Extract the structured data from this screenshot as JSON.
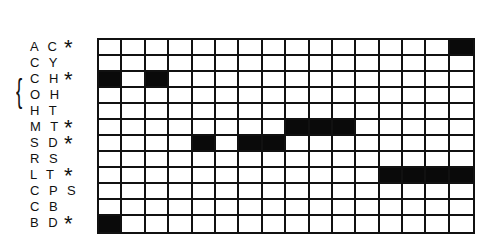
{
  "diagram": {
    "columns": 16,
    "fill_color": "#0a0a0a",
    "line_color": "#111111",
    "bracket": {
      "rows": [
        "CH",
        "OH"
      ],
      "glyph": "{"
    },
    "rows": [
      {
        "label": "A C",
        "code": "AC",
        "star": "*",
        "filled": [
          16
        ]
      },
      {
        "label": "C Y",
        "code": "CY",
        "star": "",
        "filled": []
      },
      {
        "label": "C H",
        "code": "CH",
        "star": "*",
        "filled": [
          1,
          3
        ]
      },
      {
        "label": "O H",
        "code": "OH",
        "star": "",
        "filled": []
      },
      {
        "label": "H T",
        "code": "HT",
        "star": "",
        "filled": []
      },
      {
        "label": "M T",
        "code": "MT",
        "star": "*",
        "filled": [
          9,
          10,
          11
        ]
      },
      {
        "label": "S D",
        "code": "SD",
        "star": "*",
        "filled": [
          5,
          7,
          8
        ]
      },
      {
        "label": "R S",
        "code": "RS",
        "star": "",
        "filled": []
      },
      {
        "label": "L T",
        "code": "LT",
        "star": "*",
        "filled": [
          13,
          14,
          15,
          16
        ]
      },
      {
        "label": "C P S",
        "code": "CPS",
        "star": "",
        "filled": []
      },
      {
        "label": "C B",
        "code": "CB",
        "star": "",
        "filled": []
      },
      {
        "label": "B D",
        "code": "BD",
        "star": "*",
        "filled": [
          1
        ]
      }
    ]
  }
}
